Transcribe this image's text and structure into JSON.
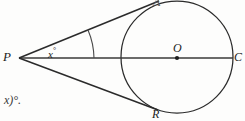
{
  "figure": {
    "kind": "geometry-diagram",
    "background_color": "#fdfdfc",
    "stroke_color": "#2b2b2b",
    "width": 245,
    "height": 121
  },
  "labels": {
    "external_point": "P",
    "tangent_point_top": "A",
    "tangent_point_bottom": "R",
    "center": "O",
    "right_point": "C",
    "angle_variable": "x",
    "degree_symbol": "°"
  },
  "angle": {
    "vertex": "P",
    "label_text": "x",
    "unit": "°"
  },
  "fragment": {
    "text": "x)°."
  },
  "geometry": {
    "circle": {
      "cx": 177,
      "cy": 57,
      "r": 56
    },
    "point_P": {
      "x": 19,
      "y": 58
    },
    "point_A": {
      "x": 158,
      "y": 2
    },
    "point_R": {
      "x": 156,
      "y": 110
    },
    "point_O": {
      "x": 177,
      "y": 57
    },
    "point_C": {
      "x": 233,
      "y": 58
    },
    "angle_arc": {
      "cx": 19,
      "cy": 58,
      "r": 75
    }
  }
}
